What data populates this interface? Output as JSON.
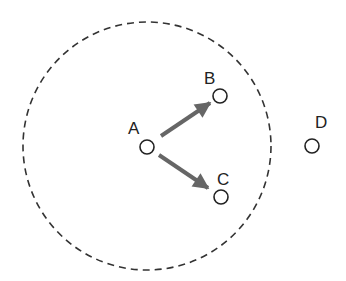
{
  "diagram": {
    "range_circle": {
      "cx": 147,
      "cy": 146,
      "r": 124,
      "style": "dashed",
      "color": "#333333"
    },
    "nodes": [
      {
        "id": "A",
        "label": "A",
        "x": 147,
        "y": 147,
        "label_x": 128,
        "label_y": 134
      },
      {
        "id": "B",
        "label": "B",
        "x": 220,
        "y": 96,
        "label_x": 204,
        "label_y": 84
      },
      {
        "id": "C",
        "label": "C",
        "x": 221,
        "y": 197,
        "label_x": 217,
        "label_y": 185
      },
      {
        "id": "D",
        "label": "D",
        "x": 312,
        "y": 146,
        "label_x": 315,
        "label_y": 128
      }
    ],
    "edges": [
      {
        "from": "A",
        "to": "B",
        "type": "arrow"
      },
      {
        "from": "A",
        "to": "C",
        "type": "arrow"
      }
    ],
    "colors": {
      "node_stroke": "#222222",
      "arrow": "#666666",
      "label": "#222222"
    }
  }
}
